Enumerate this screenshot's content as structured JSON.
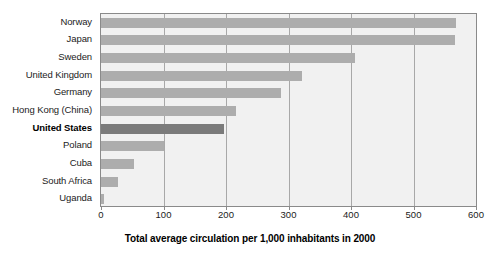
{
  "chart_data": {
    "type": "bar",
    "orientation": "horizontal",
    "title": "",
    "xlabel": "Total average circulation per 1,000 inhabitants in 2000",
    "ylabel": "",
    "xlim": [
      0,
      600
    ],
    "xticks": [
      0,
      100,
      200,
      300,
      400,
      500,
      600
    ],
    "grid": true,
    "legend": null,
    "categories": [
      "Norway",
      "Japan",
      "Sweden",
      "United Kingdom",
      "Germany",
      "Hong Kong (China)",
      "United States",
      "Poland",
      "Cuba",
      "South Africa",
      "Uganda"
    ],
    "values": [
      568,
      566,
      406,
      322,
      288,
      216,
      196,
      100,
      52,
      27,
      5
    ],
    "highlight_category": "United States",
    "colors": {
      "bar": "#adadad",
      "bar_highlight": "#7b7b7b",
      "plot_background": "#f1f1f1",
      "grid": "#a8a8a8",
      "frame": "#8a8a8a",
      "text": "#1b1b1b"
    }
  }
}
